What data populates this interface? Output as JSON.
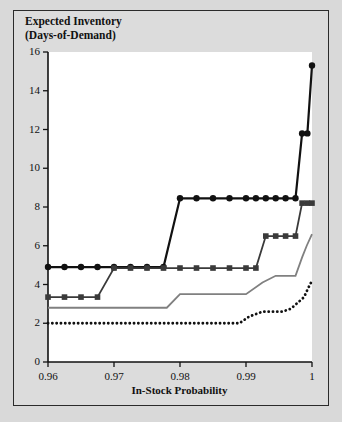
{
  "figure": {
    "background_color": "#d9d9d9",
    "plot_background_color": "#ffffff",
    "border_color": "#2b2b2b"
  },
  "chart_data": {
    "type": "line",
    "title": "Expected Inventory\n(Days-of-Demand)",
    "xlabel": "In-Stock Probability",
    "ylabel": "Expected Inventory (Days-of-Demand)",
    "xlim": [
      0.96,
      1.0
    ],
    "ylim": [
      0,
      16
    ],
    "xticks": [
      0.96,
      0.97,
      0.98,
      0.99,
      1
    ],
    "xtick_labels": [
      "0.96",
      "0.97",
      "0.98",
      "0.99",
      "1"
    ],
    "yticks": [
      0,
      2,
      4,
      6,
      8,
      10,
      12,
      14,
      16
    ],
    "ytick_labels": [
      "0",
      "2",
      "4",
      "6",
      "8",
      "10",
      "12",
      "14",
      "16"
    ],
    "grid": false,
    "legend": "none",
    "series": [
      {
        "name": "circle-series",
        "marker": "circle",
        "color": "#111111",
        "line_width": 2.2,
        "line_style": "solid",
        "x": [
          0.96,
          0.9625,
          0.965,
          0.9675,
          0.97,
          0.9725,
          0.975,
          0.9775,
          0.98,
          0.9825,
          0.985,
          0.9875,
          0.99,
          0.9915,
          0.993,
          0.9945,
          0.996,
          0.9975,
          0.9985,
          0.9993,
          1.0
        ],
        "y": [
          4.9,
          4.9,
          4.9,
          4.9,
          4.9,
          4.9,
          4.9,
          4.9,
          8.45,
          8.45,
          8.45,
          8.45,
          8.45,
          8.45,
          8.45,
          8.45,
          8.45,
          8.45,
          11.8,
          11.8,
          15.3
        ]
      },
      {
        "name": "square-series",
        "marker": "square",
        "color": "#3a3a3a",
        "line_width": 1.8,
        "line_style": "solid",
        "x": [
          0.96,
          0.9625,
          0.965,
          0.9675,
          0.97,
          0.9725,
          0.975,
          0.9775,
          0.98,
          0.9825,
          0.985,
          0.9875,
          0.99,
          0.9915,
          0.993,
          0.9945,
          0.996,
          0.9975,
          0.9985,
          0.9993,
          1.0
        ],
        "y": [
          3.35,
          3.35,
          3.35,
          3.35,
          4.85,
          4.85,
          4.85,
          4.85,
          4.85,
          4.85,
          4.85,
          4.85,
          4.85,
          4.85,
          6.5,
          6.5,
          6.5,
          6.5,
          8.2,
          8.2,
          8.2
        ]
      },
      {
        "name": "gray-line-series",
        "marker": "none",
        "color": "#808080",
        "line_width": 1.8,
        "line_style": "solid",
        "x": [
          0.96,
          0.965,
          0.97,
          0.975,
          0.978,
          0.98,
          0.985,
          0.99,
          0.9925,
          0.9945,
          0.996,
          0.9975,
          0.9985,
          0.9992,
          1.0
        ],
        "y": [
          2.8,
          2.8,
          2.8,
          2.8,
          2.8,
          3.5,
          3.5,
          3.5,
          4.1,
          4.45,
          4.45,
          4.45,
          5.4,
          6.0,
          6.6
        ]
      },
      {
        "name": "dotted-series",
        "marker": "none",
        "color": "#111111",
        "line_width": 2.4,
        "line_style": "dotted",
        "x": [
          0.96,
          0.965,
          0.97,
          0.975,
          0.98,
          0.985,
          0.989,
          0.9905,
          0.9925,
          0.994,
          0.9955,
          0.9968,
          0.9978,
          0.9988,
          0.9994,
          1.0
        ],
        "y": [
          2.0,
          2.0,
          2.0,
          2.0,
          2.0,
          2.0,
          2.0,
          2.35,
          2.6,
          2.6,
          2.6,
          2.75,
          3.05,
          3.35,
          3.8,
          4.2
        ]
      }
    ]
  }
}
